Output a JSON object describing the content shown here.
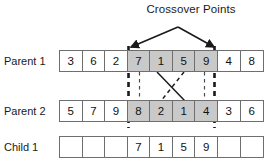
{
  "diagram": {
    "title": "Crossover Points",
    "type": "two-point-crossover",
    "colors": {
      "shaded_cell": "#c9c9c9",
      "cell_border": "#6e6e6e",
      "text": "#111111",
      "line": "#1a1a1a"
    },
    "crossover_points": {
      "left_index": 3,
      "right_index": 7,
      "labels": [
        "left-crossover-point",
        "right-crossover-point"
      ]
    },
    "rows": [
      {
        "name": "parent-1",
        "label": "Parent 1",
        "cells": [
          {
            "value": "3",
            "shaded": false
          },
          {
            "value": "6",
            "shaded": false
          },
          {
            "value": "2",
            "shaded": false
          },
          {
            "value": "7",
            "shaded": true
          },
          {
            "value": "1",
            "shaded": true
          },
          {
            "value": "5",
            "shaded": true
          },
          {
            "value": "9",
            "shaded": true
          },
          {
            "value": "4",
            "shaded": false
          },
          {
            "value": "8",
            "shaded": false
          }
        ]
      },
      {
        "name": "parent-2",
        "label": "Parent 2",
        "cells": [
          {
            "value": "5",
            "shaded": false
          },
          {
            "value": "7",
            "shaded": false
          },
          {
            "value": "9",
            "shaded": false
          },
          {
            "value": "8",
            "shaded": true
          },
          {
            "value": "2",
            "shaded": true
          },
          {
            "value": "1",
            "shaded": true
          },
          {
            "value": "4",
            "shaded": true
          },
          {
            "value": "3",
            "shaded": false
          },
          {
            "value": "6",
            "shaded": false
          }
        ]
      },
      {
        "name": "child-1",
        "label": "Child 1",
        "cells": [
          {
            "value": "",
            "shaded": false
          },
          {
            "value": "",
            "shaded": false
          },
          {
            "value": "",
            "shaded": false
          },
          {
            "value": "7",
            "shaded": false
          },
          {
            "value": "1",
            "shaded": false
          },
          {
            "value": "5",
            "shaded": false
          },
          {
            "value": "9",
            "shaded": false
          },
          {
            "value": "",
            "shaded": false
          },
          {
            "value": "",
            "shaded": false
          }
        ]
      }
    ],
    "connectors": [
      {
        "name": "solid-swap-line",
        "style": "solid"
      },
      {
        "name": "dashed-swap-line",
        "style": "dashed"
      }
    ]
  }
}
